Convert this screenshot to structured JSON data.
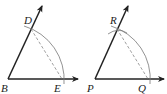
{
  "figures": [
    {
      "name": "angle-B",
      "vertex": {
        "label": "B",
        "x": 8,
        "y": 79
      },
      "ray_horizontal_end": {
        "x": 78,
        "y": 79
      },
      "ray_upper_end": {
        "x": 42,
        "y": 6
      },
      "point_on_upper": {
        "label": "D",
        "x": 31,
        "y": 29
      },
      "point_on_horizontal": {
        "label": "E",
        "x": 62,
        "y": 79
      },
      "label_positions": {
        "B": [
          1,
          92
        ],
        "D": [
          24,
          24
        ],
        "E": [
          54,
          92
        ]
      }
    },
    {
      "name": "angle-P",
      "vertex": {
        "label": "P",
        "x": 95,
        "y": 79
      },
      "ray_horizontal_end": {
        "x": 164,
        "y": 79
      },
      "ray_upper_end": {
        "x": 128,
        "y": 6
      },
      "point_on_upper": {
        "label": "R",
        "x": 117,
        "y": 29
      },
      "point_on_horizontal": {
        "label": "Q",
        "x": 148,
        "y": 79
      },
      "label_positions": {
        "P": [
          87,
          92
        ],
        "R": [
          110,
          24
        ],
        "Q": [
          138,
          92
        ]
      }
    }
  ],
  "colors": {
    "stroke": "#222222",
    "arc": "#777777",
    "dash": "#888888",
    "background": "#ffffff"
  }
}
